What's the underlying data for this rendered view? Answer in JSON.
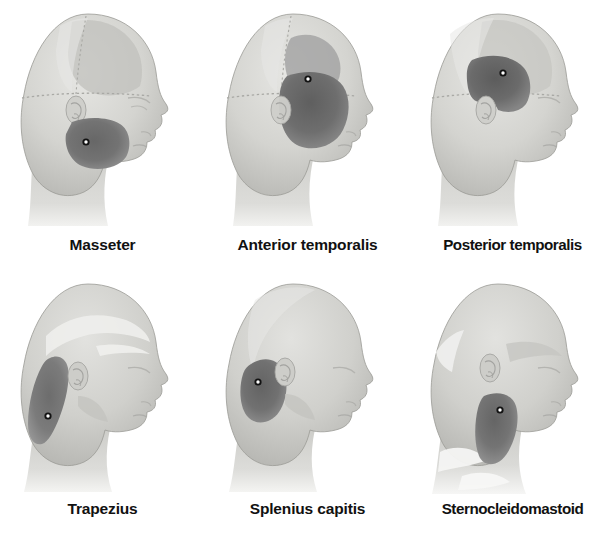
{
  "figure": {
    "background_color": "#ffffff",
    "rows": 2,
    "columns": 3,
    "style": "grayscale medical illustration, lateral head profile, right-facing"
  },
  "colors": {
    "background": "#ffffff",
    "skin_light": "#d9d9d6",
    "skin_mid": "#c6c6c2",
    "skin_shadow": "#b0b0ac",
    "skin_highlight": "#e8e8e6",
    "pain_region_dark": "#6e6e6e",
    "pain_region_mid": "#7c7c7c",
    "pain_region_light": "#9a9a9a",
    "outline": "#8a8a88",
    "label_text": "#111111",
    "marker_ring": "#121212",
    "marker_center": "#fdfdfd"
  },
  "legend": {
    "marker_meaning": "trigger point",
    "shaded_area_meaning": "referred pain pattern"
  },
  "panels": [
    {
      "id": "masseter",
      "label": "Masseter",
      "row": 0,
      "column": 0,
      "pain_region": "cheek over the mandibular ramus and angle of the jaw",
      "trigger_point": {
        "x": 0.42,
        "y": 0.6
      },
      "anatomy_markings": "cranial suture dotted lines, temporalis fan shading, external ear"
    },
    {
      "id": "anterior-temporalis",
      "label": "Anterior temporalis",
      "row": 0,
      "column": 1,
      "pain_region": "temple, extending forward over the eyebrow and down the cheek",
      "trigger_point": {
        "x": 0.5,
        "y": 0.33
      },
      "anatomy_markings": "cranial suture dotted lines, temporalis fan shading, external ear"
    },
    {
      "id": "posterior-temporalis",
      "label": "Posterior temporalis",
      "row": 0,
      "column": 2,
      "pain_region": "upper temple above and behind the ear",
      "trigger_point": {
        "x": 0.46,
        "y": 0.3
      },
      "anatomy_markings": "cranial suture dotted lines, temporalis fan shading, external ear"
    },
    {
      "id": "trapezius",
      "label": "Trapezius",
      "row": 1,
      "column": 0,
      "pain_region": "posterolateral neck curving up behind the ear to the occiput",
      "trigger_point": {
        "x": 0.32,
        "y": 0.57
      },
      "anatomy_markings": "short hair line, external ear"
    },
    {
      "id": "splenius-capitis",
      "label": "Splenius capitis",
      "row": 1,
      "column": 1,
      "pain_region": "occipital region at the back of the head behind and below the ear",
      "trigger_point": {
        "x": 0.32,
        "y": 0.46
      },
      "anatomy_markings": "external ear"
    },
    {
      "id": "sternocleidomastoid",
      "label": "Sternocleidomastoid",
      "row": 1,
      "column": 2,
      "pain_region": "lateral neck below and in front of the ear running down toward the clavicle",
      "trigger_point": {
        "x": 0.44,
        "y": 0.55
      },
      "anatomy_markings": "external ear, clavicle shading"
    }
  ]
}
